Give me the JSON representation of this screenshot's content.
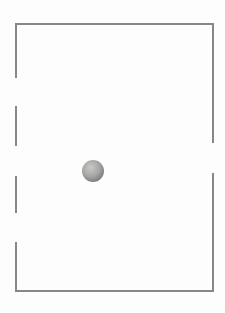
{
  "canvas": {
    "width": 225,
    "height": 313,
    "background": "#fdfdfd"
  },
  "figure": {
    "kind": "enclosure-with-wall-openings-and-ball",
    "wall_color": "#878787",
    "wall_thickness": 2,
    "wall_segments": [
      {
        "name": "top-wall",
        "x1": 16,
        "y1": 24,
        "x2": 213,
        "y2": 24
      },
      {
        "name": "bottom-wall",
        "x1": 16,
        "y1": 291,
        "x2": 213,
        "y2": 291
      },
      {
        "name": "left-wall-segment-1",
        "x1": 16,
        "y1": 24,
        "x2": 16,
        "y2": 77
      },
      {
        "name": "left-wall-segment-2",
        "x1": 16,
        "y1": 107,
        "x2": 16,
        "y2": 145
      },
      {
        "name": "left-wall-segment-3",
        "x1": 16,
        "y1": 177,
        "x2": 16,
        "y2": 212
      },
      {
        "name": "left-wall-segment-4",
        "x1": 16,
        "y1": 243,
        "x2": 16,
        "y2": 291
      },
      {
        "name": "right-wall-segment-1",
        "x1": 213,
        "y1": 24,
        "x2": 213,
        "y2": 142
      },
      {
        "name": "right-wall-segment-2",
        "x1": 213,
        "y1": 174,
        "x2": 213,
        "y2": 291
      }
    ],
    "ball": {
      "cx": 93,
      "cy": 171,
      "radius": 11,
      "highlight_color": "#c9c9c7",
      "mid_color": "#a6a6a4",
      "edge_color": "#747472"
    }
  }
}
